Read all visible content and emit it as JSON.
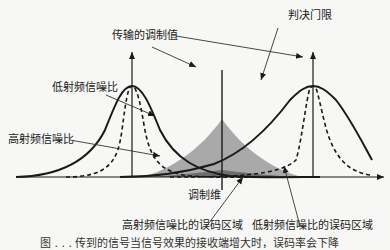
{
  "diagram": {
    "labels": {
      "transmitted_value": "传输的调制值",
      "decision_threshold": "判决门限",
      "low_snr": "低射频信噪比",
      "high_snr": "高射频信噪比",
      "modulation_dimension": "调制维",
      "high_snr_error_region": "高射频信噪比的误码区域",
      "low_snr_error_region": "低射频信噪比的误码区域"
    },
    "caption": "图 . . .  传到的信号当信号效果的接收端增大时，误码率会下降",
    "colors": {
      "curve": "#1a1a1a",
      "shade_low": "#a9a9a9",
      "shade_high": "#6e6e6e",
      "background": "#f7f7f5"
    }
  }
}
